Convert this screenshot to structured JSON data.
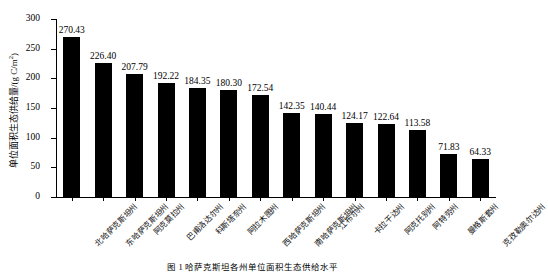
{
  "chart_data": {
    "type": "bar",
    "title": "",
    "xlabel": "",
    "ylabel": "单位面积生态供给量/(g C/m2)",
    "ylabel_main": "单位面积生态供给量/(g C/m",
    "ylabel_sup": "2",
    "ylabel_tail": ")",
    "ylim": [
      0,
      300
    ],
    "ytick_step": 50,
    "yticks": [
      "0",
      "50",
      "100",
      "150",
      "200",
      "250",
      "300"
    ],
    "grid": false,
    "legend": "none",
    "bar_color": "#000000",
    "categories": [
      "北哈萨克斯坦州",
      "东哈萨克斯坦州",
      "阿克莫拉州",
      "巴甫洛达尔州",
      "科斯塔奈州",
      "阿拉木图州",
      "西哈萨克斯坦州",
      "南哈萨克斯坦州",
      "江布尔州",
      "卡拉干达州",
      "阿克托别州",
      "阿特劳州",
      "曼格斯套州",
      "克孜勒奥尔达州"
    ],
    "values": [
      270.43,
      226.4,
      207.79,
      192.22,
      184.35,
      180.3,
      172.54,
      142.35,
      140.44,
      124.17,
      122.64,
      113.58,
      71.83,
      64.33
    ],
    "value_labels": [
      "270.43",
      "226.40",
      "207.79",
      "192.22",
      "184.35",
      "180.30",
      "172.54",
      "142.35",
      "140.44",
      "124.17",
      "122.64",
      "113.58",
      "71.83",
      "64.33"
    ]
  },
  "caption": {
    "text": "图 1    哈萨克斯坦各州单位面积生态供给水平"
  }
}
